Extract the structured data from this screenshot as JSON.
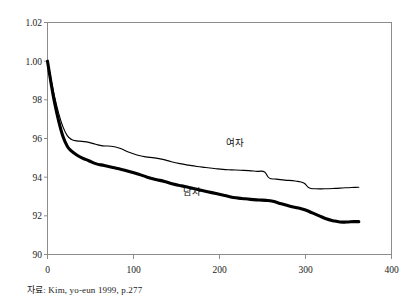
{
  "caption": {
    "source_text": "자료: Kim, yo-eun 1999, p.277"
  },
  "chart_data": {
    "type": "line",
    "title": "",
    "subtitle": "",
    "xlabel": "",
    "ylabel": "",
    "xlim": [
      0,
      400
    ],
    "ylim": [
      90,
      102
    ],
    "grid": false,
    "legend": "inline-annotations",
    "background_color": "#ffffff",
    "line_color": "#000000",
    "x_ticks": [
      0,
      100,
      200,
      300,
      400
    ],
    "x_tick_labels": [
      "0",
      "100",
      "200",
      "300",
      "400"
    ],
    "y_ticks": [
      90,
      92,
      94,
      96,
      98,
      100,
      102
    ],
    "y_tick_labels": [
      "90",
      "92",
      "94",
      "96",
      "98",
      "1.00",
      "1.02"
    ],
    "annotations": [
      {
        "text": "여자",
        "x": 218,
        "y": 95.6
      },
      {
        "text": "남자",
        "x": 168,
        "y": 93.1
      }
    ],
    "series": [
      {
        "name": "여자",
        "style": "thin",
        "x": [
          0,
          4,
          8,
          13,
          18,
          23,
          28,
          34,
          40,
          48,
          56,
          64,
          74,
          84,
          94,
          104,
          114,
          124,
          134,
          144,
          154,
          164,
          174,
          184,
          194,
          204,
          214,
          224,
          234,
          244,
          252,
          258,
          266,
          276,
          288,
          298,
          304,
          312,
          322,
          334,
          346,
          358,
          362
        ],
        "y": [
          100.0,
          99.1,
          98.2,
          97.3,
          96.6,
          96.15,
          95.95,
          95.88,
          95.85,
          95.8,
          95.7,
          95.62,
          95.6,
          95.5,
          95.3,
          95.15,
          95.05,
          95.0,
          94.92,
          94.8,
          94.7,
          94.62,
          94.55,
          94.5,
          94.45,
          94.4,
          94.38,
          94.36,
          94.34,
          94.3,
          94.28,
          93.95,
          93.9,
          93.85,
          93.8,
          93.7,
          93.45,
          93.4,
          93.4,
          93.42,
          93.45,
          93.47,
          93.48
        ]
      },
      {
        "name": "남자",
        "style": "thick",
        "x": [
          0,
          4,
          8,
          13,
          18,
          23,
          28,
          34,
          40,
          48,
          56,
          66,
          76,
          86,
          96,
          106,
          116,
          126,
          136,
          146,
          156,
          166,
          176,
          186,
          196,
          206,
          216,
          226,
          236,
          246,
          254,
          262,
          272,
          282,
          292,
          300,
          308,
          316,
          324,
          332,
          340,
          348,
          356,
          362
        ],
        "y": [
          100.0,
          98.9,
          97.9,
          96.9,
          96.1,
          95.6,
          95.35,
          95.15,
          95.0,
          94.85,
          94.7,
          94.6,
          94.5,
          94.4,
          94.28,
          94.15,
          94.0,
          93.88,
          93.78,
          93.65,
          93.55,
          93.45,
          93.35,
          93.25,
          93.15,
          93.05,
          92.95,
          92.9,
          92.85,
          92.82,
          92.8,
          92.75,
          92.62,
          92.5,
          92.4,
          92.3,
          92.15,
          92.0,
          91.85,
          91.75,
          91.68,
          91.68,
          91.7,
          91.7
        ]
      }
    ]
  }
}
